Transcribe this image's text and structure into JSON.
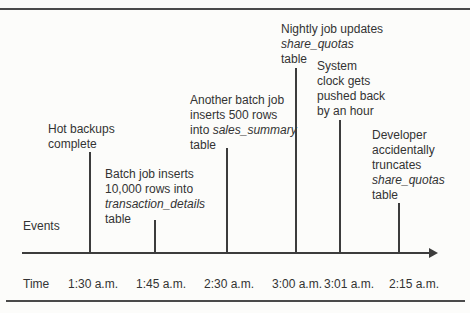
{
  "diagram": {
    "axis": {
      "events_label": "Events",
      "time_label": "Time"
    },
    "events": [
      {
        "id": "hot-backups-complete",
        "time": "1:30 a.m.",
        "lines": [
          [
            {
              "t": "Hot backups"
            }
          ],
          [
            {
              "t": "complete"
            }
          ]
        ]
      },
      {
        "id": "batch-job-inserts",
        "time": "1:45 a.m.",
        "lines": [
          [
            {
              "t": "Batch job inserts"
            }
          ],
          [
            {
              "t": "10,000 rows into"
            }
          ],
          [
            {
              "t": "transaction_details",
              "em": true
            }
          ],
          [
            {
              "t": "table"
            }
          ]
        ]
      },
      {
        "id": "another-batch-job",
        "time": "2:30 a.m.",
        "lines": [
          [
            {
              "t": "Another batch job"
            }
          ],
          [
            {
              "t": "inserts 500 rows"
            }
          ],
          [
            {
              "t": "into "
            },
            {
              "t": "sales_summary",
              "em": true
            }
          ],
          [
            {
              "t": "table"
            }
          ]
        ]
      },
      {
        "id": "nightly-job-updates",
        "time": "3:00 a.m.",
        "lines": [
          [
            {
              "t": "Nightly job updates"
            }
          ],
          [
            {
              "t": "share_quotas",
              "em": true
            }
          ],
          [
            {
              "t": "table"
            }
          ]
        ]
      },
      {
        "id": "system-clock-pushed-back",
        "time": "3:01 a.m.",
        "lines": [
          [
            {
              "t": "System"
            }
          ],
          [
            {
              "t": "clock gets"
            }
          ],
          [
            {
              "t": "pushed back"
            }
          ],
          [
            {
              "t": "by an hour"
            }
          ]
        ]
      },
      {
        "id": "developer-truncates",
        "time": "2:15 a.m.",
        "lines": [
          [
            {
              "t": "Developer"
            }
          ],
          [
            {
              "t": "accidentally"
            }
          ],
          [
            {
              "t": "truncates"
            }
          ],
          [
            {
              "t": "share_quotas",
              "em": true
            }
          ],
          [
            {
              "t": "table"
            }
          ]
        ]
      }
    ]
  }
}
